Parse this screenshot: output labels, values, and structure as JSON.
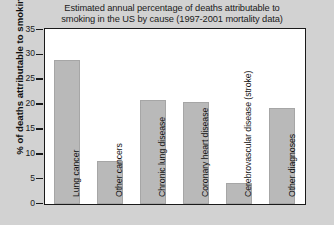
{
  "chart_data": {
    "type": "bar",
    "title": "Estimated annual percentage of deaths attributable to smoking in the US by cause (1997-2001 mortality data)",
    "title_lines": [
      "Estimated annual percentage of deaths attributable to",
      "smoking in the US by cause (1997-2001 mortality data)"
    ],
    "xlabel": "",
    "ylabel": "% of deaths attributable to smoking",
    "ylim": [
      0,
      35
    ],
    "yticks": [
      0,
      5,
      10,
      15,
      20,
      25,
      30,
      35
    ],
    "ytick_labels": [
      "0",
      "5",
      "10",
      "15",
      "20",
      "25",
      "30",
      "35"
    ],
    "grid": false,
    "legend": "none",
    "bar_color": "#b9b9b9",
    "plot_background": "#ffffff",
    "page_background": "#d2d2d2",
    "axis_color": "#1a1a1a",
    "categories": [
      "Lung cancer",
      "Other cancers",
      "Chronic lung disease",
      "Coronary heart disease",
      "Cerebrovascular disease (stroke)",
      "Other diagnoses"
    ],
    "values": [
      29.0,
      8.7,
      21.0,
      20.5,
      4.3,
      19.4
    ]
  }
}
